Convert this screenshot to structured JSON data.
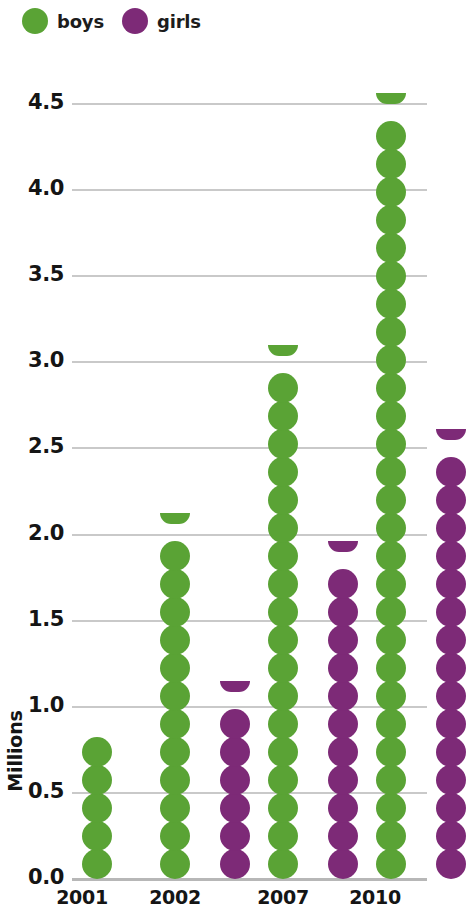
{
  "legend": {
    "items": [
      {
        "key": "boys",
        "label": "boys",
        "color": "#5aa335"
      },
      {
        "key": "girls",
        "label": "girls",
        "color": "#7d2a77"
      }
    ]
  },
  "chart_data": {
    "type": "bar",
    "subtype": "pictorial-dot-column",
    "title": "",
    "xlabel": "",
    "ylabel": "Millions",
    "ylim": [
      0.0,
      4.5
    ],
    "ytick_labels": [
      "4.5",
      "4.0",
      "3.5",
      "3.0",
      "2.5",
      "2.0",
      "1.5",
      "1.0",
      "0.5",
      "0.0"
    ],
    "ytick_values": [
      4.5,
      4.0,
      3.5,
      3.0,
      2.5,
      2.0,
      1.5,
      1.0,
      0.5,
      0.0
    ],
    "grid": true,
    "legend_position": "top-left",
    "categories": [
      "2001",
      "2002",
      "2007",
      "2010"
    ],
    "series": [
      {
        "name": "boys",
        "color": "#5aa335",
        "values": [
          0.7,
          2.12,
          3.06,
          4.45
        ],
        "dot_counts": [
          5,
          13,
          19,
          28
        ]
      },
      {
        "name": "girls",
        "color": "#7d2a77",
        "values": [
          null,
          1.13,
          1.95,
          2.52
        ],
        "dot_counts": [
          0,
          7,
          12,
          16
        ]
      }
    ],
    "dot_unit": 0.1627
  }
}
